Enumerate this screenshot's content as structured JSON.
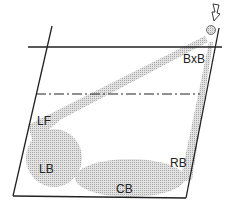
{
  "diagram": {
    "labels": {
      "bxb": "BxB",
      "lf": "LF",
      "lb": "LB",
      "cb": "CB",
      "rb": "RB"
    },
    "colors": {
      "line": "#222222",
      "shade": "#c8c8c8"
    }
  }
}
